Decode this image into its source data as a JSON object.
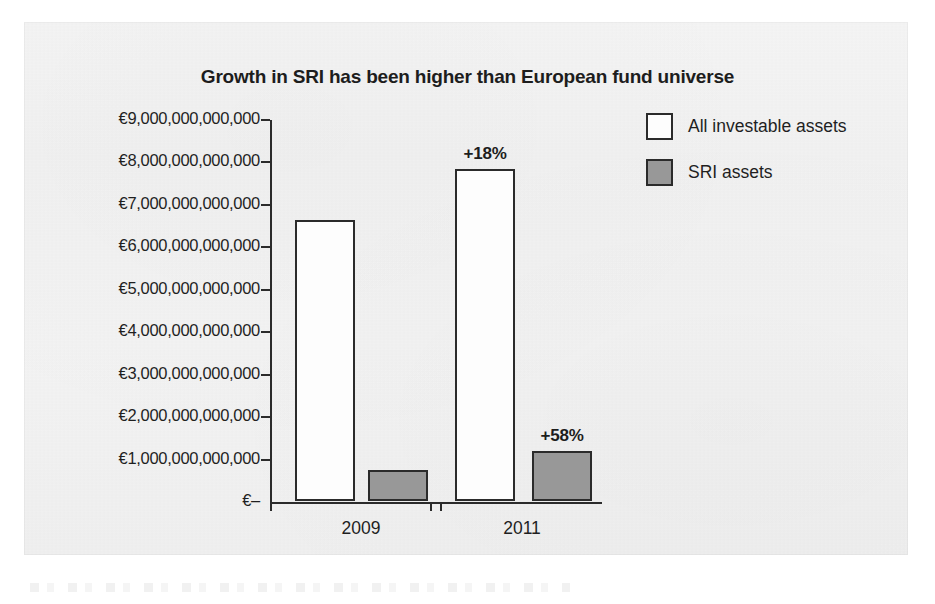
{
  "chart_data": {
    "type": "bar",
    "title": "Growth in SRI has been higher than European fund universe",
    "xlabel": "",
    "ylabel": "",
    "categories": [
      "2009",
      "2011"
    ],
    "series": [
      {
        "name": "All investable assets",
        "color": "#fdfdfd",
        "values": [
          6620000000000,
          7830000000000
        ],
        "labels": [
          "",
          "+18%"
        ]
      },
      {
        "name": "SRI assets",
        "color": "#989898",
        "values": [
          720000000000,
          1180000000000
        ],
        "labels": [
          "",
          "+58%"
        ]
      }
    ],
    "ylim": [
      0,
      9000000000000
    ],
    "ytick_values": [
      9000000000000,
      8000000000000,
      7000000000000,
      6000000000000,
      5000000000000,
      4000000000000,
      3000000000000,
      2000000000000,
      1000000000000,
      0
    ],
    "ytick_labels": [
      "€9,000,000,000,000",
      "€8,000,000,000,000",
      "€7,000,000,000,000",
      "€6,000,000,000,000",
      "€5,000,000,000,000",
      "€4,000,000,000,000",
      "€3,000,000,000,000",
      "€2,000,000,000,000",
      "€1,000,000,000,000",
      "€–"
    ],
    "annotations": [
      "+18%",
      "+58%"
    ],
    "grid": false,
    "legend_position": "top-right"
  },
  "legend": {
    "items": [
      {
        "label": "All investable assets",
        "color": "#fdfdfd"
      },
      {
        "label": "SRI assets",
        "color": "#989898"
      }
    ]
  },
  "axis": {
    "zero_label": "€–"
  }
}
